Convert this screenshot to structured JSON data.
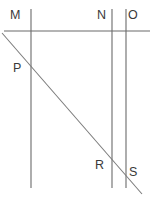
{
  "figure": {
    "kind": "geometry-diagram",
    "width": 156,
    "height": 201,
    "background_color": "#ffffff",
    "line_color": "#6b6b6b",
    "label_color": "#3a3a3a",
    "labels": {
      "m": "M",
      "n": "N",
      "o": "O",
      "p": "P",
      "r": "R",
      "s": "S"
    },
    "label_positions": {
      "m": {
        "x": 10,
        "y": 9
      },
      "n": {
        "x": 97,
        "y": 9
      },
      "o": {
        "x": 128,
        "y": 9
      },
      "p": {
        "x": 13,
        "y": 62
      },
      "r": {
        "x": 95,
        "y": 159
      },
      "s": {
        "x": 129,
        "y": 166
      }
    },
    "geometry": {
      "horizontal_line": {
        "x1": 4,
        "y1": 31,
        "x2": 150,
        "y2": 31
      },
      "vertical_lines": [
        {
          "name": "line-m",
          "x1": 31,
          "y1": 9,
          "x2": 31,
          "y2": 188
        },
        {
          "name": "line-n",
          "x1": 112,
          "y1": 9,
          "x2": 112,
          "y2": 188
        },
        {
          "name": "line-o",
          "x1": 126,
          "y1": 9,
          "x2": 126,
          "y2": 188
        }
      ],
      "transversal_line": {
        "x1": 2,
        "y1": 33,
        "x2": 142,
        "y2": 194
      }
    }
  }
}
